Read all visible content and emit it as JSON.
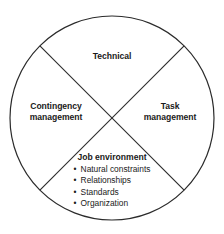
{
  "diagram": {
    "type": "quadrant-circle",
    "shape": "circle divided into four quadrants by two diagonal lines",
    "stroke_color": "#2b2b2b",
    "background_color": "#ffffff",
    "text_color": "#1a1a1a",
    "quadrants": {
      "top": {
        "label": "Technical"
      },
      "left": {
        "label_line1": "Contingency",
        "label_line2": "management"
      },
      "right": {
        "label_line1": "Task",
        "label_line2": "management"
      },
      "bottom": {
        "heading": "Job environment",
        "bullet_marker": "•",
        "items": [
          "Natural constraints",
          "Relationships",
          "Standards",
          "Organization"
        ]
      }
    }
  }
}
